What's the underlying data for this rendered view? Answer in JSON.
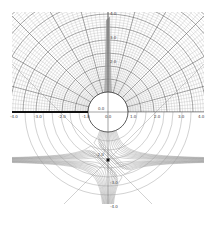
{
  "figure": {
    "colors": {
      "background": "#ffffff",
      "grid_fine": "#b8b8b8",
      "grid_major": "#555555",
      "branch_cut": "#111111",
      "axis": "#333333"
    },
    "axes": {
      "x_ticks": [
        "-4.0",
        "-3.0",
        "-2.0",
        "-1.0",
        "0.0",
        "1.0",
        "2.0",
        "3.0",
        "4.0"
      ],
      "y_ticks_top": [
        "4.0",
        "3.0",
        "2.0"
      ],
      "y_label_center": "0.0",
      "y_ticks_bottom": [
        "-2.0",
        "-3.0",
        "-4.0"
      ],
      "label_near_stagnation": "-2.0"
    },
    "features": {
      "circle": {
        "cx": 0,
        "cy": 0,
        "r": 1
      },
      "branch_cut": {
        "from": -4,
        "to": -1
      },
      "stagnation_point": {
        "x": 0,
        "y": -2
      }
    }
  }
}
